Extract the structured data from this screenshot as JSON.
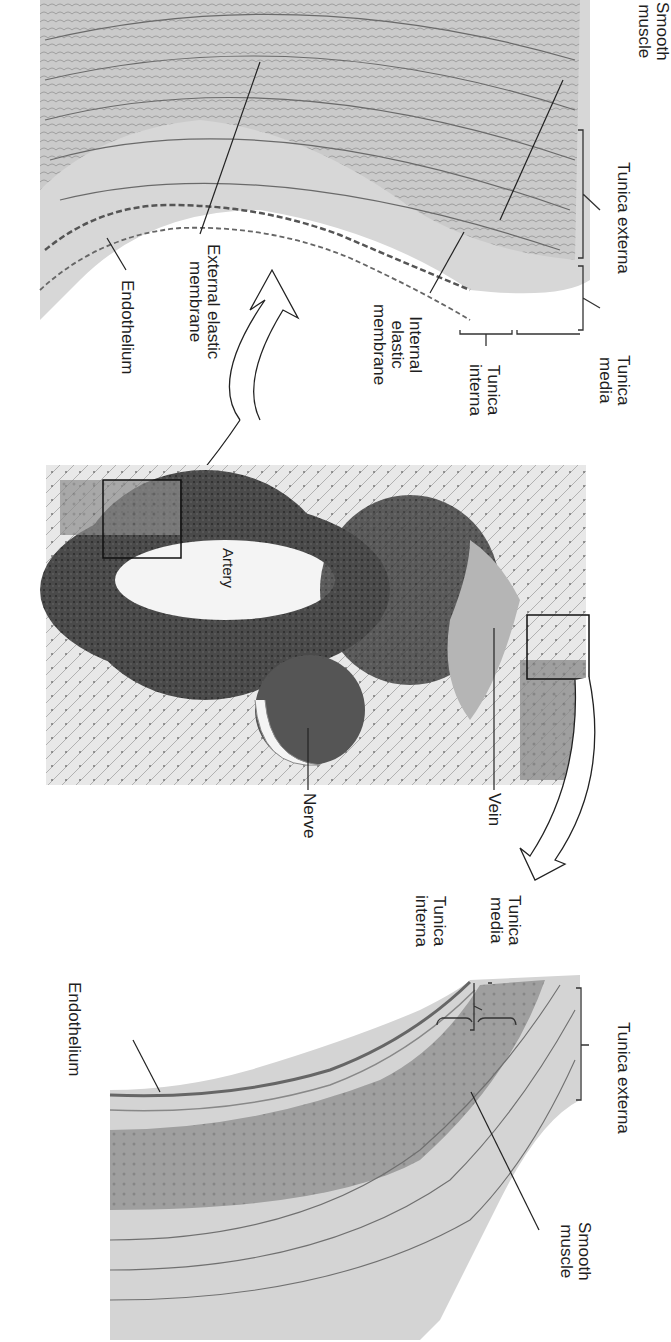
{
  "figure": {
    "orientation": "rotated 90 degrees clockwise",
    "panels": [
      {
        "name": "artery-wall-detail",
        "position": "top"
      },
      {
        "name": "micrograph",
        "position": "middle"
      },
      {
        "name": "vein-wall-detail",
        "position": "bottom"
      }
    ]
  },
  "artery_detail": {
    "labels": {
      "smooth_muscle_1": "Smooth",
      "smooth_muscle_2": "muscle",
      "tunica_externa": "Tunica externa",
      "tunica_media_1": "Tunica",
      "tunica_media_2": "media",
      "tunica_interna_1": "Tunica",
      "tunica_interna_2": "interna",
      "internal_elastic_1": "Internal",
      "internal_elastic_2": "elastic",
      "internal_elastic_3": "membrane",
      "external_elastic_1": "External elastic",
      "external_elastic_2": "membrane",
      "endothelium": "Endothelium"
    }
  },
  "micrograph": {
    "labels": {
      "artery": "Artery",
      "vein": "Vein",
      "nerve": "Nerve"
    }
  },
  "vein_detail": {
    "labels": {
      "tunica_media_1": "Tunica",
      "tunica_media_2": "media",
      "tunica_interna_1": "Tunica",
      "tunica_interna_2": "interna",
      "tunica_externa": "Tunica externa",
      "endothelium": "Endothelium",
      "smooth_muscle_1": "Smooth",
      "smooth_muscle_2": "muscle"
    }
  }
}
